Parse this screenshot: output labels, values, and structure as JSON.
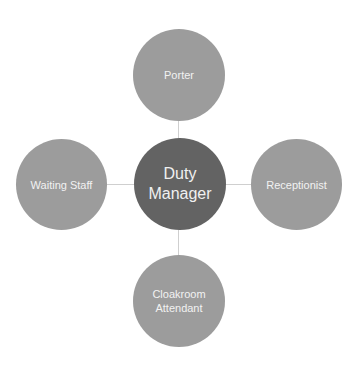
{
  "diagram": {
    "type": "radial-org",
    "center": {
      "label": "Duty Manager",
      "line1": "Duty",
      "line2": "Manager",
      "color": "#636363"
    },
    "nodes": [
      {
        "id": "top",
        "label": "Porter",
        "color": "#9c9c9c"
      },
      {
        "id": "right",
        "label": "Receptionist",
        "color": "#9c9c9c"
      },
      {
        "id": "bottom",
        "label": "Cloakroom Attendant",
        "line1": "Cloakroom",
        "line2": "Attendant",
        "color": "#9c9c9c"
      },
      {
        "id": "left",
        "label": "Waiting Staff",
        "color": "#9c9c9c"
      }
    ],
    "connector_color": "#cfcfcf"
  }
}
